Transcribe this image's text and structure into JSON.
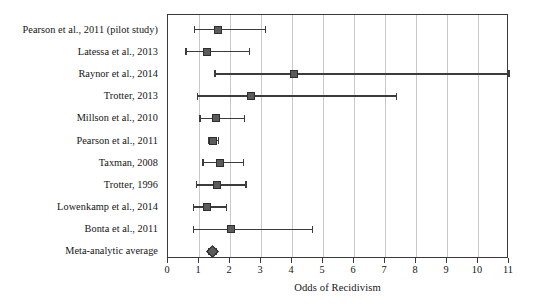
{
  "chart_data": {
    "type": "scatter",
    "subtype": "forest-plot",
    "title": "",
    "xlabel": "Odds of Recidivism",
    "ylabel": "",
    "xlim": [
      0,
      11
    ],
    "xticks": [
      0,
      1,
      2,
      3,
      4,
      5,
      6,
      7,
      8,
      9,
      10,
      11
    ],
    "xticklabels": [
      "0",
      "1",
      "2",
      "3",
      "4",
      "5",
      "6",
      "7",
      "8",
      "9",
      "10",
      "11"
    ],
    "grid": "vertical-gridlines-at-integer-ticks",
    "legend": "none",
    "marker_color": "#5b5b5b",
    "line_color": "#3c3c3c",
    "grid_color": "#c9c9c9",
    "frame_color": "#3a3a3a",
    "categories": [
      "Pearson et al., 2011 (pilot study)",
      "Latessa et al., 2013",
      "Raynor et al., 2014",
      "Trotter, 2013",
      "Millson et al., 2010",
      "Pearson et al., 2011",
      "Taxman, 2008",
      "Trotter, 1996",
      "Lowenkamp et al., 2014",
      "Bonta et al., 2011",
      "Meta-analytic average"
    ],
    "rows": [
      {
        "label": "Pearson et al., 2011 (pilot study)",
        "estimate": 1.62,
        "ci_low": 0.85,
        "ci_high": 3.15,
        "marker": "square"
      },
      {
        "label": "Latessa et al., 2013",
        "estimate": 1.25,
        "ci_low": 0.58,
        "ci_high": 2.62,
        "marker": "square"
      },
      {
        "label": "Raynor et al., 2014",
        "estimate": 4.08,
        "ci_low": 1.52,
        "ci_high": 11.0,
        "marker": "square"
      },
      {
        "label": "Trotter, 2013",
        "estimate": 2.68,
        "ci_low": 0.96,
        "ci_high": 7.38,
        "marker": "square"
      },
      {
        "label": "Millson et al., 2010",
        "estimate": 1.56,
        "ci_low": 1.03,
        "ci_high": 2.46,
        "marker": "square"
      },
      {
        "label": "Pearson et al., 2011",
        "estimate": 1.45,
        "ci_low": 1.31,
        "ci_high": 1.62,
        "marker": "square"
      },
      {
        "label": "Taxman, 2008",
        "estimate": 1.68,
        "ci_low": 1.13,
        "ci_high": 2.44,
        "marker": "square"
      },
      {
        "label": "Trotter, 1996",
        "estimate": 1.58,
        "ci_low": 0.92,
        "ci_high": 2.52,
        "marker": "square"
      },
      {
        "label": "Lowenkamp et al., 2014",
        "estimate": 1.27,
        "ci_low": 0.82,
        "ci_high": 1.88,
        "marker": "square"
      },
      {
        "label": "Bonta et al., 2011",
        "estimate": 2.03,
        "ci_low": 0.82,
        "ci_high": 4.65,
        "marker": "square"
      },
      {
        "label": "Meta-analytic average",
        "estimate": 1.44,
        "ci_low": 1.32,
        "ci_high": 1.57,
        "marker": "diamond"
      }
    ]
  }
}
